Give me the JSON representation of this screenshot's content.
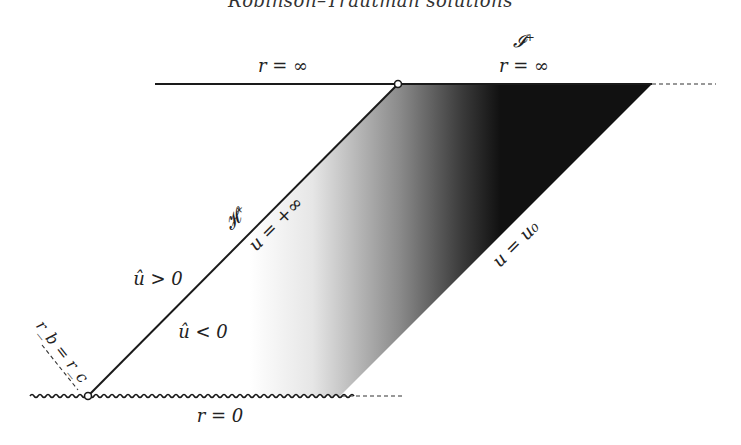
{
  "title": "Robinson–Trautman solutions",
  "labels": {
    "scri_plus": "𝓘⁺",
    "r_inf_left": "r = ∞",
    "r_inf_right": "r = ∞",
    "horizon": "𝓗⁺",
    "u_plus_inf": "u = +∞",
    "u_u0": "u = u₀",
    "uhat_pos": "û > 0",
    "uhat_neg": "û < 0",
    "rb_rc": "r_b = r_c",
    "r_zero": "r = 0"
  },
  "colors": {
    "line": "#1a1a1a",
    "gradient_light": "#ffffff",
    "gradient_dark": "#111111"
  },
  "geometry": {
    "top_y": 84,
    "bottom_y": 396,
    "horizon_top_x": 398,
    "horizon_bottom_x": 88,
    "u0_top_x": 652,
    "u0_bottom_x": 340
  }
}
